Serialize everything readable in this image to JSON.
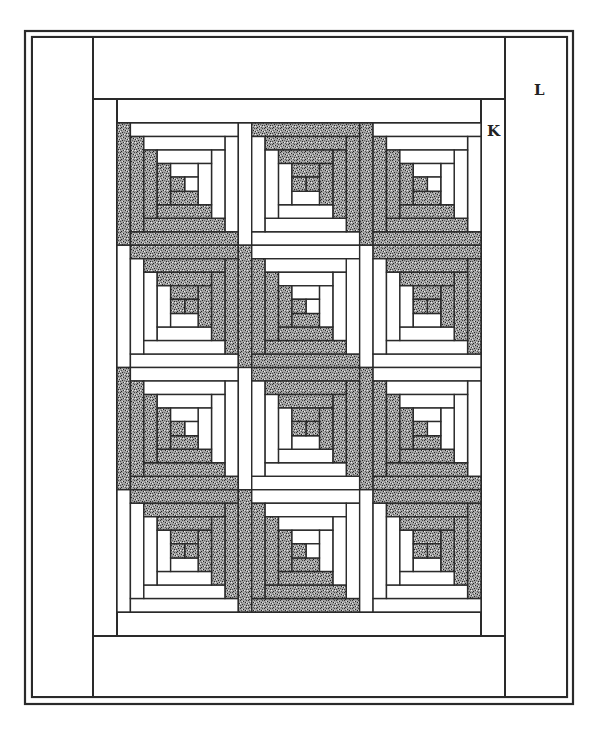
{
  "diagram": {
    "colors": {
      "line": "#2a2a2a",
      "light_fabric": "#ffffff",
      "dark_fabric_base": "#9a9a9a",
      "dark_fabric_speck": "#3a3a3a",
      "background": "#ffffff"
    },
    "frame": {
      "outer": {
        "x": 25,
        "y": 31,
        "w": 548,
        "h": 673
      },
      "inner": {
        "x": 32,
        "y": 37,
        "w": 535,
        "h": 660
      }
    },
    "border_L": {
      "label": "L",
      "label_pos": {
        "x": 534,
        "y": 83
      },
      "left_column": {
        "x": 32,
        "y": 37,
        "w": 61,
        "h": 660
      },
      "right_column": {
        "x": 505,
        "y": 37,
        "w": 62,
        "h": 660
      },
      "top_band": {
        "x": 93,
        "y": 37,
        "w": 412,
        "h": 62
      },
      "bottom_band": {
        "x": 93,
        "y": 636,
        "w": 412,
        "h": 61
      }
    },
    "border_K": {
      "label": "K",
      "label_pos": {
        "x": 487,
        "y": 124
      },
      "left_strip": {
        "x": 93,
        "y": 99,
        "w": 24,
        "h": 537
      },
      "right_strip": {
        "x": 481,
        "y": 99,
        "w": 24,
        "h": 537
      },
      "top_strip": {
        "x": 117,
        "y": 99,
        "w": 364,
        "h": 24
      },
      "bottom_strip": {
        "x": 117,
        "y": 612,
        "w": 364,
        "h": 24
      }
    },
    "blocks": {
      "origin": {
        "x": 117,
        "y": 123
      },
      "cols": 3,
      "rows": 4,
      "block_w": 121.33,
      "block_h": 122.25,
      "rounds": 4,
      "center_fabric": "dark",
      "pattern": [
        [
          "A",
          "B",
          "A"
        ],
        [
          "B",
          "A",
          "B"
        ],
        [
          "A",
          "B",
          "A"
        ],
        [
          "B",
          "A",
          "B"
        ]
      ],
      "types": {
        "A": {
          "description": "dark logs on left and bottom, light logs on top and right",
          "left": "dark",
          "bottom": "dark",
          "top": "light",
          "right": "light"
        },
        "B": {
          "description": "light logs on left and bottom, dark logs on top and right",
          "left": "light",
          "bottom": "light",
          "top": "dark",
          "right": "dark"
        }
      }
    }
  }
}
